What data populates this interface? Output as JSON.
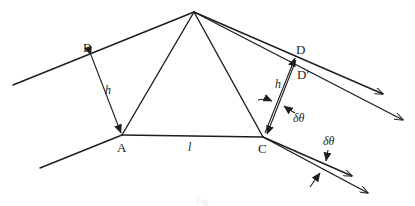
{
  "diagram": {
    "points": {
      "A": "A",
      "B": "B",
      "C": "C",
      "D": "D",
      "D_prime": "D'"
    },
    "symbols": {
      "h_left": "h",
      "h_right": "h",
      "l": "l",
      "delta_theta_1": "δθ",
      "delta_theta_2": "δθ"
    },
    "caption": "Fig."
  },
  "colors": {
    "stroke": "#1e1e1e",
    "background": "#ffffff"
  }
}
